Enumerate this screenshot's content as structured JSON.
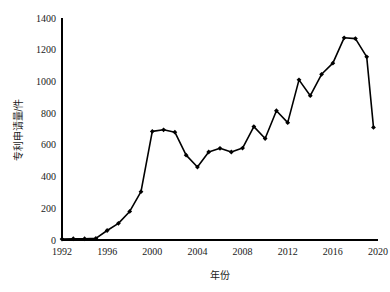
{
  "chart_data": {
    "type": "line",
    "title": "",
    "xlabel": "年份",
    "ylabel": "专利申请量/件",
    "xlim": [
      1992,
      2020
    ],
    "ylim": [
      0,
      1400
    ],
    "grid": false,
    "legend": false,
    "legend_position": "none",
    "xticks": [
      "1992",
      "1996",
      "2000",
      "2004",
      "2008",
      "2012",
      "2016",
      "2020"
    ],
    "xtick_values": [
      1992,
      1996,
      2000,
      2004,
      2008,
      2012,
      2016,
      2020
    ],
    "yticks": [
      "0",
      "200",
      "400",
      "600",
      "800",
      "1000",
      "1200",
      "1400"
    ],
    "ytick_values": [
      0,
      200,
      400,
      600,
      800,
      1000,
      1200,
      1400
    ],
    "marker": "diamond",
    "line_color": "#000000",
    "marker_color": "#000000",
    "background_color": "#ffffff",
    "x": [
      1992,
      1993,
      1994,
      1995,
      1996,
      1997,
      1998,
      1999,
      2000,
      2001,
      2002,
      2003,
      2004,
      2005,
      2006,
      2007,
      2008,
      2009,
      2010,
      2011,
      2012,
      2013,
      2014,
      2015,
      2016,
      2017,
      2018,
      2019
    ],
    "values": [
      6,
      8,
      8,
      10,
      60,
      105,
      180,
      305,
      685,
      695,
      680,
      535,
      460,
      555,
      578,
      555,
      580,
      715,
      640,
      815,
      740,
      1010,
      910,
      1045,
      1115,
      1275,
      1270,
      1155
    ],
    "series": [
      {
        "name": "专利申请量",
        "values": [
          6,
          8,
          8,
          10,
          60,
          105,
          180,
          305,
          685,
          695,
          680,
          535,
          460,
          555,
          578,
          555,
          580,
          715,
          640,
          815,
          740,
          1010,
          910,
          1045,
          1115,
          1275,
          1270,
          1155
        ]
      }
    ],
    "final_point": {
      "x": 2019.6,
      "y": 710
    }
  }
}
